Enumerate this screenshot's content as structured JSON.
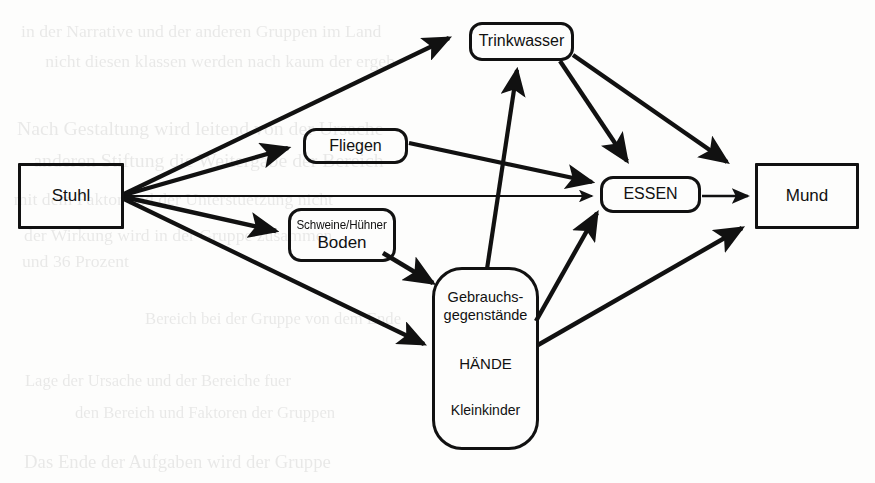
{
  "diagram": {
    "background": "#fdfdfc",
    "ink_color": "#111111",
    "nodes": {
      "stuhl": {
        "label": "Stuhl",
        "shape": "rectangle"
      },
      "trinkwasser": {
        "label": "Trinkwasser",
        "shape": "rounded-rectangle"
      },
      "fliegen": {
        "label": "Fliegen",
        "shape": "rounded-rectangle"
      },
      "boden": {
        "line1": "Schweine/Hühner",
        "line2": "Boden",
        "shape": "rounded-rectangle"
      },
      "gebrauchsgegenstaende": {
        "line1": "Gebrauchs-",
        "line2": "gegenstände",
        "line3": "HÄNDE",
        "line4": "Kleinkinder",
        "shape": "rounded-rectangle"
      },
      "essen": {
        "label": "ESSEN",
        "shape": "rounded-rectangle"
      },
      "mund": {
        "label": "Mund",
        "shape": "rectangle"
      }
    },
    "edges": [
      {
        "from": "stuhl",
        "to": "trinkwasser"
      },
      {
        "from": "stuhl",
        "to": "fliegen"
      },
      {
        "from": "stuhl",
        "to": "essen"
      },
      {
        "from": "stuhl",
        "to": "boden"
      },
      {
        "from": "stuhl",
        "to": "gebrauchsgegenstaende"
      },
      {
        "from": "fliegen",
        "to": "essen"
      },
      {
        "from": "boden",
        "to": "gebrauchsgegenstaende"
      },
      {
        "from": "gebrauchsgegenstaende",
        "to": "trinkwasser"
      },
      {
        "from": "gebrauchsgegenstaende",
        "to": "essen"
      },
      {
        "from": "gebrauchsgegenstaende",
        "to": "mund"
      },
      {
        "from": "trinkwasser",
        "to": "essen"
      },
      {
        "from": "trinkwasser",
        "to": "mund"
      },
      {
        "from": "essen",
        "to": "mund"
      }
    ]
  },
  "background_text": {
    "note": "faint bleed-through from reverse of scanned page, illegible",
    "lines": [
      {
        "t": "in der Narrative und der anderen Gruppen im Land",
        "x": 28,
        "y": 22,
        "s": 17
      },
      {
        "t": "nicht diesen klassen werden nach kaum der ergeb",
        "x": 52,
        "y": 52,
        "s": 17
      },
      {
        "t": "Nach Gestaltung wird leitend von der Ursache",
        "x": 24,
        "y": 118,
        "s": 19
      },
      {
        "t": "anderen Stiftung die Weitergabe der Bereich",
        "x": 40,
        "y": 150,
        "s": 19
      },
      {
        "t": "mit dem Faktor und der Unterstuetzung nicht",
        "x": 20,
        "y": 190,
        "s": 17
      },
      {
        "t": "der Wirkung wird in der Gruppe zusammen",
        "x": 30,
        "y": 226,
        "s": 17
      },
      {
        "t": "und 36 Prozent",
        "x": 24,
        "y": 252,
        "s": 17
      },
      {
        "t": "Bereich bei der Gruppe von dem Ende",
        "x": 150,
        "y": 310,
        "s": 16
      },
      {
        "t": "Lage der Ursache und der Bereiche fuer",
        "x": 30,
        "y": 372,
        "s": 16
      },
      {
        "t": "den Bereich und Faktoren der Gruppen",
        "x": 80,
        "y": 404,
        "s": 16
      },
      {
        "t": "Das Ende der Aufgaben wird der Gruppe",
        "x": 30,
        "y": 452,
        "s": 18
      }
    ]
  }
}
